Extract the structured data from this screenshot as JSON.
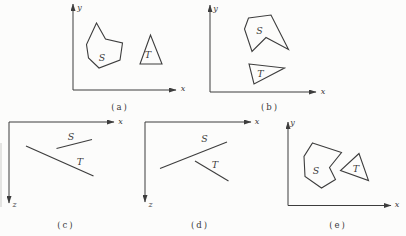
{
  "figure": {
    "colors": {
      "ink": "#3d3d3d",
      "paper": "#fcfcfb"
    },
    "panels": [
      {
        "id": "a",
        "caption": "(a)",
        "caption_pos": [
          120,
          107
        ],
        "axes": [
          {
            "name": "y-axis",
            "from": [
              73,
              90
            ],
            "to": [
              73,
              4
            ],
            "label": "y",
            "label_pos": [
              79.5,
              7.5
            ]
          },
          {
            "name": "x-axis",
            "from": [
              73,
              90
            ],
            "to": [
              176,
              90
            ],
            "label": "x",
            "label_pos": [
              183,
              88.5
            ]
          }
        ],
        "shapes": [
          {
            "kind": "polygon",
            "label": "S",
            "label_pos": [
              102,
              57
            ],
            "points": [
              [
                96.5,
                23
              ],
              [
                105.5,
                39
              ],
              [
                122.5,
                43
              ],
              [
                120,
                60
              ],
              [
                99,
                68
              ],
              [
                88.5,
                58
              ],
              [
                86.5,
                44.5
              ]
            ]
          },
          {
            "kind": "polygon",
            "label": "T",
            "label_pos": [
              148,
              54
            ],
            "points": [
              [
                150.5,
                35
              ],
              [
                140,
                64
              ],
              [
                162,
                64
              ]
            ]
          }
        ]
      },
      {
        "id": "b",
        "caption": "(b)",
        "caption_pos": [
          270,
          107
        ],
        "axes": [
          {
            "name": "y-axis",
            "from": [
              210,
              92
            ],
            "to": [
              210,
              5
            ],
            "label": "y",
            "label_pos": [
              215.5,
              8
            ]
          },
          {
            "name": "x-axis",
            "from": [
              210,
              92
            ],
            "to": [
              316,
              92
            ],
            "label": "x",
            "label_pos": [
              323,
              91
            ]
          }
        ],
        "shapes": [
          {
            "kind": "polygon",
            "label": "S",
            "label_pos": [
              259.5,
              30
            ],
            "points": [
              [
                248.5,
                18
              ],
              [
                271,
                15
              ],
              [
                288.5,
                49.5
              ],
              [
                266,
                37.5
              ],
              [
                252,
                51.5
              ],
              [
                244.5,
                29
              ]
            ]
          },
          {
            "kind": "polygon",
            "label": "T",
            "label_pos": [
              260.5,
              73.5
            ],
            "points": [
              [
                249,
                64
              ],
              [
                284.5,
                68
              ],
              [
                254,
                84
              ]
            ]
          }
        ]
      },
      {
        "id": "c",
        "caption": "(c)",
        "caption_pos": [
          66,
          225
        ],
        "axes": [
          {
            "name": "x-axis",
            "from": [
              9,
              122
            ],
            "to": [
              114,
              122
            ],
            "label": "x",
            "label_pos": [
              120.5,
              121.5
            ]
          },
          {
            "name": "z-axis",
            "from": [
              9,
              122
            ],
            "to": [
              9,
              203
            ],
            "label": "z",
            "label_pos": [
              14.5,
              204.5
            ]
          }
        ],
        "shapes": [
          {
            "kind": "segment",
            "label": "S",
            "label_pos": [
              71,
              136
            ],
            "points": [
              [
                56.5,
                148.5
              ],
              [
                92,
                139.5
              ]
            ]
          },
          {
            "kind": "segment",
            "label": "T",
            "label_pos": [
              80,
              161
            ],
            "points": [
              [
                26,
                146
              ],
              [
                93.5,
                176
              ]
            ]
          }
        ]
      },
      {
        "id": "d",
        "caption": "(d)",
        "caption_pos": [
          200,
          225
        ],
        "axes": [
          {
            "name": "x-axis",
            "from": [
              145,
              122
            ],
            "to": [
              251,
              122
            ],
            "label": "x",
            "label_pos": [
              257,
              121.5
            ]
          },
          {
            "name": "z-axis",
            "from": [
              145,
              122
            ],
            "to": [
              145,
              202
            ],
            "label": "z",
            "label_pos": [
              150.5,
              204.5
            ]
          }
        ],
        "shapes": [
          {
            "kind": "segment",
            "label": "S",
            "label_pos": [
              204.5,
              138.5
            ],
            "points": [
              [
                160,
                168.5
              ],
              [
                227,
                142
              ]
            ]
          },
          {
            "kind": "segment",
            "label": "T",
            "label_pos": [
              215,
              164.5
            ],
            "points": [
              [
                195,
                161
              ],
              [
                228.5,
                181
              ]
            ]
          }
        ]
      },
      {
        "id": "e",
        "caption": "(e)",
        "caption_pos": [
          338,
          225
        ],
        "axes": [
          {
            "name": "y-axis",
            "from": [
              288,
              205.5
            ],
            "to": [
              288,
              122
            ],
            "label": "y",
            "label_pos": [
              292.5,
              122.5
            ]
          },
          {
            "name": "x-axis",
            "from": [
              288,
              205.5
            ],
            "to": [
              391,
              205.5
            ],
            "label": "x",
            "label_pos": [
              397,
              204.5
            ]
          }
        ],
        "shapes": [
          {
            "kind": "polygon",
            "label": "S",
            "label_pos": [
              316,
              170.5
            ],
            "points": [
              [
                312.5,
                143
              ],
              [
                341.5,
                152.5
              ],
              [
                329.5,
                167.5
              ],
              [
                335.5,
                179.5
              ],
              [
                321.5,
                188
              ],
              [
                305,
                176.5
              ],
              [
                304,
                156.5
              ]
            ]
          },
          {
            "kind": "polygon",
            "label": "T",
            "label_pos": [
              356,
              168
            ],
            "points": [
              [
                359,
                153.5
              ],
              [
                340.5,
                170.5
              ],
              [
                368.5,
                180.5
              ]
            ]
          }
        ]
      }
    ]
  }
}
